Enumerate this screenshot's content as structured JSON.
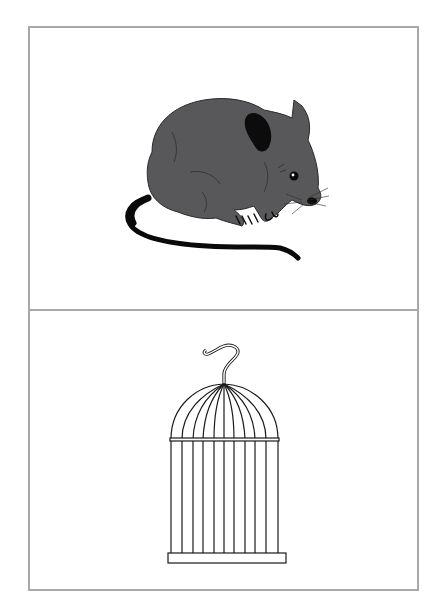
{
  "card": {
    "border_color": "#a8a8a8",
    "panels": [
      {
        "label": "mouse",
        "illustration": "mouse-illustration",
        "fill": "#58585a"
      },
      {
        "label": "cage",
        "illustration": "birdcage-illustration",
        "stroke": "#1a1a1a"
      }
    ]
  }
}
